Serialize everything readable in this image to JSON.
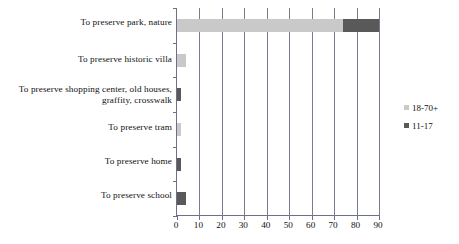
{
  "chart_data": {
    "type": "bar",
    "orientation": "horizontal",
    "stacked": true,
    "title": "",
    "subtitle": "",
    "xlabel": "",
    "ylabel": "",
    "xlim": [
      0,
      90
    ],
    "ylim": null,
    "grid": true,
    "legend_position": "right",
    "categories": [
      "To preserve park, nature",
      "To preserve  historic villa",
      "To preserve shopping center, old houses, graffity, crosswalk",
      "To preserve  tram",
      "To preserve home",
      "To preserve  school"
    ],
    "series": [
      {
        "name": "18-70+",
        "color": "#c9c9c9",
        "values": [
          74,
          4,
          0,
          2,
          0,
          0
        ]
      },
      {
        "name": "11-17",
        "color": "#595959",
        "values": [
          16,
          0,
          2,
          0,
          2,
          4
        ]
      }
    ],
    "xticks": [
      0,
      10,
      20,
      30,
      40,
      50,
      60,
      70,
      80,
      90
    ],
    "xticklabels": [
      "0",
      "10",
      "20",
      "30",
      "40",
      "50",
      "60",
      "70",
      "80",
      "90"
    ]
  },
  "legend": {
    "items": [
      {
        "label": "18-70+",
        "color": "#c9c9c9"
      },
      {
        "label": "11-17",
        "color": "#595959"
      }
    ]
  },
  "colors": {
    "axis": "#6e6e85",
    "grid": "#7a7a90",
    "background": "#ffffff",
    "text": "#111111",
    "series_18_70": "#c9c9c9",
    "series_11_17": "#595959"
  }
}
